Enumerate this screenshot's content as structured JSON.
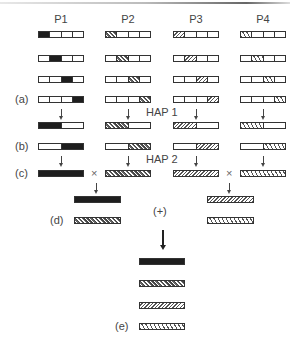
{
  "columns": [
    {
      "id": "p1",
      "label": "P1",
      "x": 38,
      "pattern": "solid-black"
    },
    {
      "id": "p2",
      "label": "P2",
      "x": 105,
      "pattern": "dense-crosshatch"
    },
    {
      "id": "p3",
      "label": "P3",
      "x": 173,
      "pattern": "fine-diagonal"
    },
    {
      "id": "p4",
      "label": "P4",
      "x": 240,
      "pattern": "coarse-diagonal"
    }
  ],
  "row_labels": {
    "a": "(a)",
    "b": "(b)",
    "c": "(c)",
    "d": "(d)",
    "e": "(e)"
  },
  "step_labels": {
    "hap1": "HAP 1",
    "hap2": "HAP 2",
    "plus": "(+)",
    "cross": "×"
  },
  "segment_rows": [
    {
      "y": 31,
      "filled_segment": 0
    },
    {
      "y": 55,
      "filled_segment": 1
    },
    {
      "y": 76,
      "filled_segment": 2
    },
    {
      "y": 96,
      "filled_segment": 3
    }
  ],
  "hap1_row": {
    "y": 122,
    "filled_half": "left"
  },
  "b_row": {
    "y": 143,
    "filled_half": "right"
  },
  "c_row": {
    "y": 170,
    "filled_half": "full"
  },
  "d_left": {
    "x": 74,
    "bars": [
      {
        "y": 196,
        "pattern": "p1"
      },
      {
        "y": 217,
        "pattern": "p2"
      }
    ]
  },
  "d_right": {
    "x": 207,
    "bars": [
      {
        "y": 196,
        "pattern": "p3"
      },
      {
        "y": 217,
        "pattern": "p4"
      }
    ]
  },
  "e_bars": [
    {
      "y": 258,
      "pattern": "p1"
    },
    {
      "y": 280,
      "pattern": "p2"
    },
    {
      "y": 302,
      "pattern": "p3"
    },
    {
      "y": 323,
      "pattern": "p4"
    }
  ]
}
